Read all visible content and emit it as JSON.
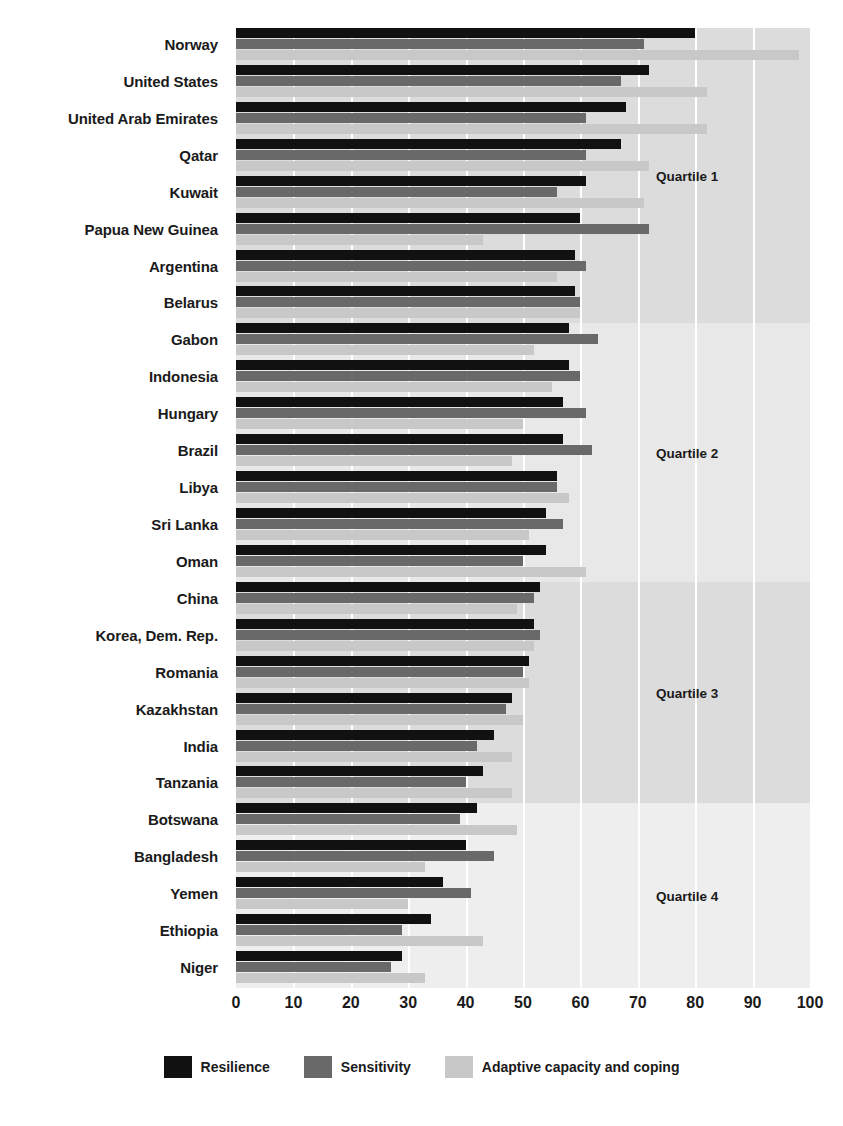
{
  "chart_data": {
    "type": "bar",
    "orientation": "horizontal",
    "title": "",
    "subtitle": "",
    "xlabel": "",
    "ylabel": "",
    "xlim": [
      0,
      100
    ],
    "xticks": [
      0,
      10,
      20,
      30,
      40,
      50,
      60,
      70,
      80,
      90,
      100
    ],
    "xtick_labels": [
      "0",
      "10",
      "20",
      "30",
      "40",
      "50",
      "60",
      "70",
      "80",
      "90",
      "100"
    ],
    "grid": true,
    "grid_axis": "x",
    "legend_position": "bottom",
    "categories": [
      "Norway",
      "United States",
      "United Arab Emirates",
      "Qatar",
      "Kuwait",
      "Papua New Guinea",
      "Argentina",
      "Belarus",
      "Gabon",
      "Indonesia",
      "Hungary",
      "Brazil",
      "Libya",
      "Sri Lanka",
      "Oman",
      "China",
      "Korea, Dem. Rep.",
      "Romania",
      "Kazakhstan",
      "India",
      "Tanzania",
      "Botswana",
      "Bangladesh",
      "Yemen",
      "Ethiopia",
      "Niger"
    ],
    "series": [
      {
        "name": "Resilience",
        "color": "#111111",
        "values": [
          80,
          72,
          68,
          67,
          61,
          60,
          59,
          59,
          58,
          58,
          57,
          57,
          56,
          54,
          54,
          53,
          52,
          51,
          48,
          45,
          43,
          42,
          40,
          36,
          34,
          29
        ]
      },
      {
        "name": "Sensitivity",
        "color": "#696969",
        "values": [
          71,
          67,
          61,
          61,
          56,
          72,
          61,
          60,
          63,
          60,
          61,
          62,
          56,
          57,
          50,
          52,
          53,
          50,
          47,
          42,
          40,
          39,
          45,
          41,
          29,
          27
        ]
      },
      {
        "name": "Adaptive capacity and coping",
        "color": "#c8c8c8",
        "values": [
          98,
          82,
          82,
          72,
          71,
          43,
          56,
          60,
          52,
          55,
          50,
          48,
          58,
          51,
          61,
          49,
          52,
          51,
          50,
          48,
          48,
          49,
          33,
          30,
          43,
          33
        ]
      }
    ],
    "quartiles": [
      {
        "label": "Quartile 1",
        "start_index": 0,
        "end_index": 7,
        "band_color": "#dcdcdc"
      },
      {
        "label": "Quartile 2",
        "start_index": 8,
        "end_index": 14,
        "band_color": "#e8e8e8"
      },
      {
        "label": "Quartile 3",
        "start_index": 15,
        "end_index": 20,
        "band_color": "#dcdcdc"
      },
      {
        "label": "Quartile 4",
        "start_index": 21,
        "end_index": 25,
        "band_color": "#eeeeee"
      }
    ]
  },
  "legend": {
    "items": [
      {
        "label": "Resilience",
        "color": "#111111"
      },
      {
        "label": "Sensitivity",
        "color": "#696969"
      },
      {
        "label": "Adaptive capacity and coping",
        "color": "#c8c8c8"
      }
    ]
  },
  "colors": {
    "resilience": "#111111",
    "sensitivity": "#696969",
    "adaptive": "#c8c8c8",
    "band_dark": "#dcdcdc",
    "band_light": "#e8e8e8",
    "band_lightest": "#eeeeee",
    "gridline": "#ffffff",
    "text": "#1a1a1a",
    "background": "#ffffff"
  }
}
